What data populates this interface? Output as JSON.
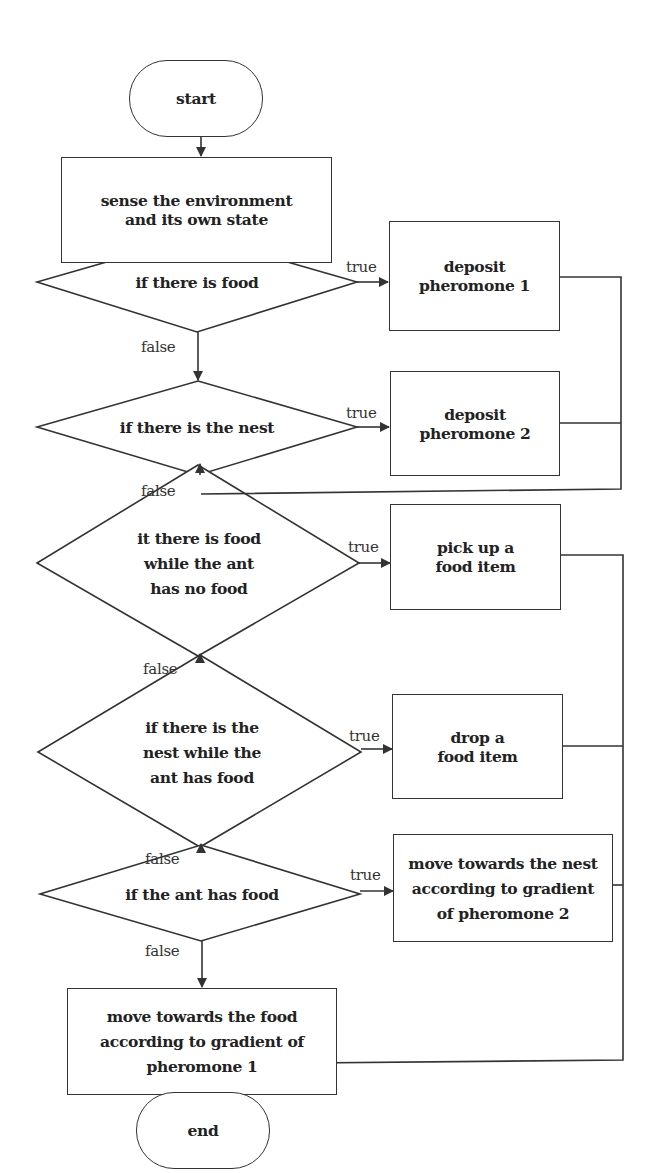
{
  "diagram": {
    "type": "flowchart",
    "nodes": {
      "start": "start",
      "sense": "sense the environment and its own state",
      "cond_food": "if there is food",
      "deposit1": "deposit pheromone 1",
      "cond_nest": "if there is the nest",
      "deposit2": "deposit pheromone 2",
      "cond_food_no_food": "it there is food while the ant has no food",
      "pickup": "pick up a food item",
      "cond_nest_has_food": "if there is the nest while the ant has food",
      "drop": "drop a food item",
      "cond_has_food": "if the ant has food",
      "move_nest": "move towards the nest according to gradient of pheromone 2",
      "move_food": "move towards the food according to gradient of pheromone 1",
      "end": "end"
    },
    "labels": {
      "true": "true",
      "false": "false"
    },
    "edges": [
      {
        "from": "start",
        "to": "sense"
      },
      {
        "from": "sense",
        "to": "cond_food"
      },
      {
        "from": "cond_food",
        "to": "deposit1",
        "label": "true"
      },
      {
        "from": "cond_food",
        "to": "cond_nest",
        "label": "false"
      },
      {
        "from": "cond_nest",
        "to": "deposit2",
        "label": "true"
      },
      {
        "from": "cond_nest",
        "to": "cond_food_no_food",
        "label": "false"
      },
      {
        "from": "deposit1",
        "to": "cond_food_no_food"
      },
      {
        "from": "deposit2",
        "to": "cond_food_no_food"
      },
      {
        "from": "cond_food_no_food",
        "to": "pickup",
        "label": "true"
      },
      {
        "from": "cond_food_no_food",
        "to": "cond_nest_has_food",
        "label": "false"
      },
      {
        "from": "cond_nest_has_food",
        "to": "drop",
        "label": "true"
      },
      {
        "from": "cond_nest_has_food",
        "to": "cond_has_food",
        "label": "false"
      },
      {
        "from": "cond_has_food",
        "to": "move_nest",
        "label": "true"
      },
      {
        "from": "cond_has_food",
        "to": "move_food",
        "label": "false"
      },
      {
        "from": "pickup",
        "to": "end"
      },
      {
        "from": "drop",
        "to": "end"
      },
      {
        "from": "move_nest",
        "to": "end"
      },
      {
        "from": "move_food",
        "to": "end"
      }
    ],
    "colors": {
      "stroke": "#333333",
      "text": "#222222",
      "background": "#ffffff"
    }
  },
  "display": {
    "start": "start",
    "sense_l1": "sense the environment",
    "sense_l2": "and its own state",
    "cond_food": "if there is food",
    "deposit1_l1": "deposit",
    "deposit1_l2": "pheromone 1",
    "cond_nest": "if there is the nest",
    "deposit2_l1": "deposit",
    "deposit2_l2": "pheromone 2",
    "c3_l1": "it there is food",
    "c3_l2": "while the ant",
    "c3_l3": "has no food",
    "pickup_l1": "pick up a",
    "pickup_l2": "food item",
    "c4_l1": "if there is the",
    "c4_l2": "nest while the",
    "c4_l3": "ant has food",
    "drop_l1": "drop a",
    "drop_l2": "food item",
    "cond_has_food": "if the ant has food",
    "mn_l1": "move towards the nest",
    "mn_l2": "according to gradient",
    "mn_l3": "of pheromone 2",
    "mf_l1": "move towards the food",
    "mf_l2": "according to gradient of",
    "mf_l3": "pheromone 1",
    "end": "end",
    "true": "true",
    "false": "false"
  }
}
